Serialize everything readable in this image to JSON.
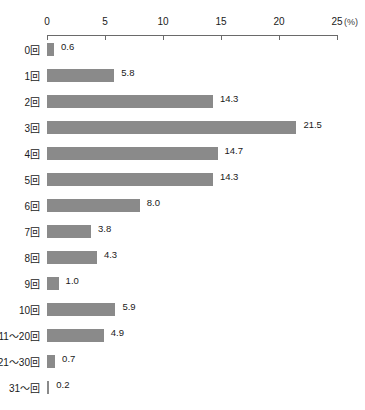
{
  "title_remnant": "",
  "axis": {
    "unit_label": "(%)",
    "ticks": [
      0,
      5,
      10,
      15,
      20,
      25
    ],
    "tick_labels": [
      "0",
      "5",
      "10",
      "15",
      "20",
      "25"
    ]
  },
  "colors": {
    "bar_fill": "#8a8a8a",
    "bar_shadow": "#3d3d3d",
    "axis": "#6a6a6a",
    "text": "#1a1a1a",
    "background": "#ffffff"
  },
  "chart_data": {
    "type": "bar",
    "orientation": "horizontal",
    "title": "",
    "xlabel": "(%)",
    "ylabel": "",
    "xlim": [
      0,
      25
    ],
    "grid": false,
    "legend": false,
    "categories": [
      "0回",
      "1回",
      "2回",
      "3回",
      "4回",
      "5回",
      "6回",
      "7回",
      "8回",
      "9回",
      "10回",
      "11〜20回",
      "21〜30回",
      "31〜回"
    ],
    "values": [
      0.6,
      5.8,
      14.3,
      21.5,
      14.7,
      14.3,
      8.0,
      3.8,
      4.3,
      1.0,
      5.9,
      4.9,
      0.7,
      0.2
    ],
    "value_labels": [
      "0.6",
      "5.8",
      "14.3",
      "21.5",
      "14.7",
      "14.3",
      "8.0",
      "3.8",
      "4.3",
      "1.0",
      "5.9",
      "4.9",
      "0.7",
      "0.2"
    ]
  }
}
